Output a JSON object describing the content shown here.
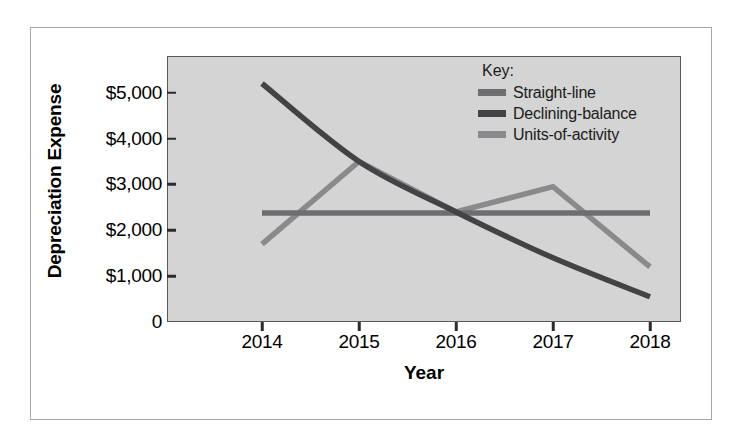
{
  "figure": {
    "bleed_text_top": "",
    "bleed_text_1": "",
    "bleed_text_2": ""
  },
  "legend": {
    "title": "Key:",
    "items": [
      {
        "label": "Straight-line",
        "color": "#6e6e70"
      },
      {
        "label": "Declining-balance",
        "color": "#434345"
      },
      {
        "label": "Units-of-activity",
        "color": "#8a8a8c"
      }
    ]
  },
  "chart_data": {
    "type": "line",
    "title": "",
    "xlabel": "Year",
    "ylabel": "Depreciation Expense",
    "categories": [
      "2014",
      "2015",
      "2016",
      "2017",
      "2018"
    ],
    "x": [
      2014,
      2015,
      2016,
      2017,
      2018
    ],
    "ylim": [
      0,
      5800
    ],
    "ytick_values": [
      0,
      1000,
      2000,
      3000,
      4000,
      5000
    ],
    "ytick_labels": [
      "0",
      "$1,000",
      "$2,000",
      "$3,000",
      "$4,000",
      "$5,000"
    ],
    "grid": false,
    "legend_position": "top-right inside plot",
    "series": [
      {
        "name": "Straight-line",
        "color": "#6e6e70",
        "values": [
          2375,
          2375,
          2375,
          2375,
          2375
        ],
        "style": "flat"
      },
      {
        "name": "Declining-balance",
        "color": "#434345",
        "values": [
          5200,
          3500,
          2400,
          1400,
          550
        ],
        "style": "curve"
      },
      {
        "name": "Units-of-activity",
        "color": "#8a8a8c",
        "values": [
          1700,
          3500,
          2400,
          2950,
          1200
        ],
        "style": "straight"
      }
    ]
  }
}
